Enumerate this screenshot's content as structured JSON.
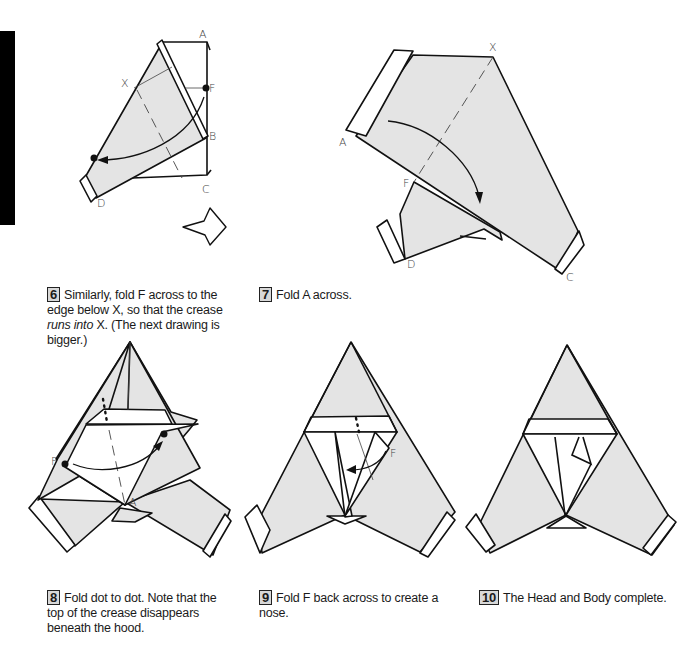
{
  "page": {
    "side_bar_color": "#000000",
    "paper_color": "#e4e4e4"
  },
  "steps": [
    {
      "number": "6",
      "text_parts": [
        {
          "text": "Similarly, fold F across to the edge below X, so that the crease ",
          "italic": false
        },
        {
          "text": "runs into",
          "italic": true
        },
        {
          "text": " X. (The next drawing is bigger.)",
          "italic": false
        }
      ],
      "labels": {
        "a": "A",
        "f": "F",
        "x": "X",
        "b": "B",
        "c": "C",
        "d": "D"
      },
      "icon": "turn-over-arrow-icon"
    },
    {
      "number": "7",
      "text": "Fold A across.",
      "labels": {
        "x": "X",
        "a": "A",
        "f": "F",
        "d": "D",
        "c": "C"
      }
    },
    {
      "number": "8",
      "text": "Fold dot to dot. Note that the top of the crease disappears beneath the hood.",
      "labels": {
        "f": "F",
        "a": "A"
      }
    },
    {
      "number": "9",
      "text": "Fold F back across to create a nose.",
      "labels": {
        "f": "F"
      }
    },
    {
      "number": "10",
      "text": "The Head and Body complete.",
      "labels": {}
    }
  ]
}
